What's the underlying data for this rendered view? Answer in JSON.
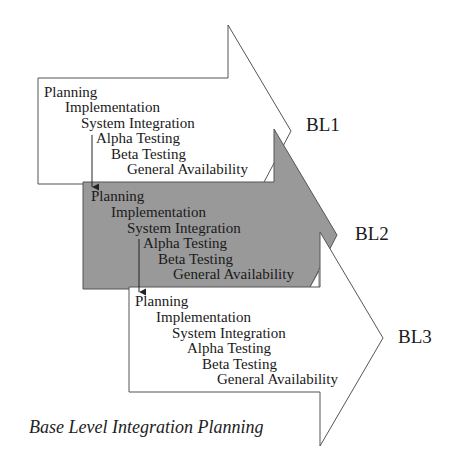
{
  "diagram": {
    "caption": "Base Level Integration Planning",
    "base_levels": [
      {
        "label": "BL1",
        "fill": "#ffffff",
        "stages": [
          "Planning",
          "Implementation",
          "System Integration",
          "Alpha Testing",
          "Beta Testing",
          "General Availability"
        ]
      },
      {
        "label": "BL2",
        "fill": "#999999",
        "stages": [
          "Planning",
          "Implementation",
          "System Integration",
          "Alpha Testing",
          "Beta Testing",
          "General Availability"
        ]
      },
      {
        "label": "BL3",
        "fill": "#ffffff",
        "stages": [
          "Planning",
          "Implementation",
          "System Integration",
          "Alpha Testing",
          "Beta Testing",
          "General Availability"
        ]
      }
    ],
    "connectors": [
      {
        "from": "BL1.Alpha Testing",
        "to": "BL2.Planning"
      },
      {
        "from": "BL2.Alpha Testing",
        "to": "BL3.Planning"
      }
    ]
  }
}
